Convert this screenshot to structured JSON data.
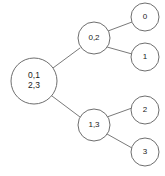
{
  "diagram": {
    "type": "tree",
    "background_color": "#ffffff",
    "stroke_color": "#6e6e6e",
    "edge_color": "#7a7a7a",
    "text_color": "#1a1a1a",
    "nodes": [
      {
        "id": "root",
        "label_line1": "0,1",
        "label_line2": "2,3",
        "cx": 34,
        "cy": 81,
        "r": 23,
        "role": "root"
      },
      {
        "id": "internal-top",
        "label_line1": "0,2",
        "label_line2": "",
        "cx": 94,
        "cy": 38,
        "r": 16,
        "role": "internal"
      },
      {
        "id": "internal-bottom",
        "label_line1": "1,3",
        "label_line2": "",
        "cx": 94,
        "cy": 125,
        "r": 16,
        "role": "internal"
      },
      {
        "id": "leaf-0",
        "label_line1": "0",
        "label_line2": "",
        "cx": 145,
        "cy": 17,
        "r": 14,
        "role": "leaf"
      },
      {
        "id": "leaf-1",
        "label_line1": "1",
        "label_line2": "",
        "cx": 145,
        "cy": 57,
        "r": 14,
        "role": "leaf"
      },
      {
        "id": "leaf-2",
        "label_line1": "2",
        "label_line2": "",
        "cx": 145,
        "cy": 110,
        "r": 14,
        "role": "leaf"
      },
      {
        "id": "leaf-3",
        "label_line1": "3",
        "label_line2": "",
        "cx": 145,
        "cy": 152,
        "r": 14,
        "role": "leaf"
      }
    ],
    "edges": [
      {
        "id": "edge-root-top",
        "from": "root",
        "to": "internal-top",
        "x1": 53,
        "y1": 68,
        "x2": 80,
        "y2": 48
      },
      {
        "id": "edge-root-bottom",
        "from": "root",
        "to": "internal-bottom",
        "x1": 52,
        "y1": 96,
        "x2": 80,
        "y2": 117
      },
      {
        "id": "edge-top-leaf0",
        "from": "internal-top",
        "to": "leaf-0",
        "x1": 108,
        "y1": 31,
        "x2": 132,
        "y2": 22
      },
      {
        "id": "edge-top-leaf1",
        "from": "internal-top",
        "to": "leaf-1",
        "x1": 107,
        "y1": 47,
        "x2": 132,
        "y2": 54
      },
      {
        "id": "edge-bottom-leaf2",
        "from": "internal-bottom",
        "to": "leaf-2",
        "x1": 107,
        "y1": 117,
        "x2": 132,
        "y2": 108
      },
      {
        "id": "edge-bottom-leaf3",
        "from": "internal-bottom",
        "to": "leaf-3",
        "x1": 107,
        "y1": 134,
        "x2": 132,
        "y2": 148
      }
    ]
  }
}
